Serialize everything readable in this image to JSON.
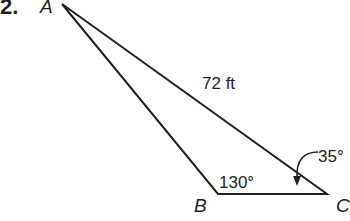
{
  "problem": {
    "number": "2."
  },
  "triangle": {
    "vertices": [
      {
        "name": "A",
        "x": 62,
        "y": 4
      },
      {
        "name": "B",
        "x": 218,
        "y": 194
      },
      {
        "name": "C",
        "x": 327,
        "y": 194
      }
    ],
    "side_AC_label": "72 ft",
    "angle_B_label": "130°",
    "angle_C_label": "35°",
    "line_color": "#231f20"
  }
}
